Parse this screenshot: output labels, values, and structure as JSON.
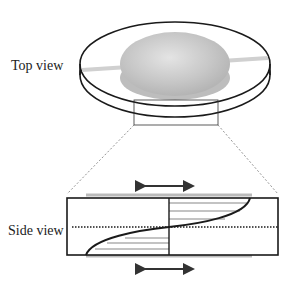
{
  "labels": {
    "top_view": "Top view",
    "side_view": "Side view"
  },
  "diagram": {
    "colors": {
      "outline": "#1a1a1a",
      "sample": "#c8c8c8",
      "dashed": "#777777",
      "hatch": "#555555"
    },
    "arrows": [
      "top-plate-motion",
      "bottom-plate-motion"
    ]
  }
}
